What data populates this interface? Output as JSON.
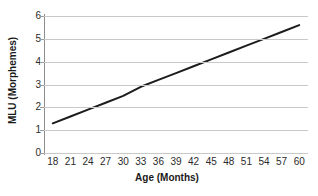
{
  "chart_data": {
    "type": "line",
    "title": "",
    "xlabel": "Age (Months)",
    "ylabel": "MLU (Morphemes)",
    "x": [
      18,
      21,
      24,
      27,
      30,
      33,
      36,
      39,
      42,
      45,
      48,
      51,
      54,
      57,
      60
    ],
    "values": [
      1.3,
      1.6,
      1.9,
      2.2,
      2.5,
      2.9,
      3.2,
      3.5,
      3.8,
      4.1,
      4.4,
      4.7,
      5.0,
      5.3,
      5.6
    ],
    "series": [
      {
        "name": "MLU",
        "values": [
          1.3,
          1.6,
          1.9,
          2.2,
          2.5,
          2.9,
          3.2,
          3.5,
          3.8,
          4.1,
          4.4,
          4.7,
          5.0,
          5.3,
          5.6
        ]
      }
    ],
    "xtick_labels": [
      "18",
      "21",
      "24",
      "27",
      "30",
      "33",
      "36",
      "39",
      "42",
      "45",
      "48",
      "51",
      "54",
      "57",
      "60"
    ],
    "ytick_labels": [
      "0",
      "1",
      "2",
      "3",
      "4",
      "5",
      "6"
    ],
    "yticks": [
      0,
      1,
      2,
      3,
      4,
      5,
      6
    ],
    "xlim": [
      16.5,
      61.5
    ],
    "ylim": [
      0,
      6
    ],
    "grid": "horizontal",
    "legend": "none",
    "line_color": "#1c1c1c",
    "grid_color": "#c9c9c9",
    "axis_color": "#8d8d8d",
    "background_color": "#ffffff"
  }
}
